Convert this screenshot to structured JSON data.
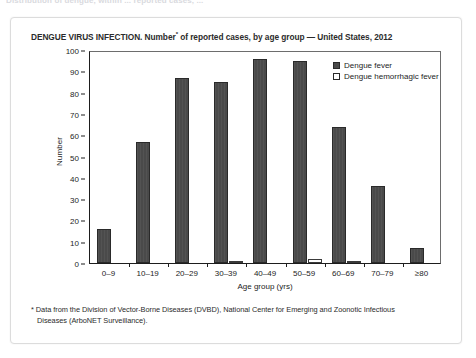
{
  "top_cut_text": "Distribution of dengue, within ... reported cases, ...",
  "figure": {
    "title_prefix": "DENGUE VIRUS INFECTION. Number",
    "title_footnote_marker": "*",
    "title_suffix": " of reported cases, by age group — United States, 2012",
    "footnote_line1": "* Data from the Division of Vector-Borne Diseases (DVBD), National Center for Emerging and Zoonotic Infectious",
    "footnote_line2": "Diseases (ArboNET Surveillance)."
  },
  "chart_data": {
    "type": "bar",
    "title": "DENGUE VIRUS INFECTION. Number* of reported cases, by age group — United States, 2012",
    "xlabel": "Age group (yrs)",
    "ylabel": "Number",
    "ylim": [
      0,
      100
    ],
    "ytick_step": 10,
    "yticks": [
      100,
      90,
      80,
      70,
      60,
      50,
      40,
      30,
      20,
      10,
      0
    ],
    "grid": false,
    "legend_position": "top-right-inside",
    "categories": [
      "0–9",
      "10–19",
      "20–29",
      "30–39",
      "40–49",
      "50–59",
      "60–69",
      "70–79",
      "≥80"
    ],
    "series": [
      {
        "name": "Dengue fever",
        "color": "#4a4a4a",
        "values": [
          16,
          57,
          87,
          85,
          96,
          95,
          64,
          36,
          7
        ]
      },
      {
        "name": "Dengue hemorrhagic fever",
        "color": "#ffffff",
        "values": [
          0,
          0,
          0,
          1,
          0,
          2,
          1,
          0,
          0
        ]
      }
    ]
  }
}
